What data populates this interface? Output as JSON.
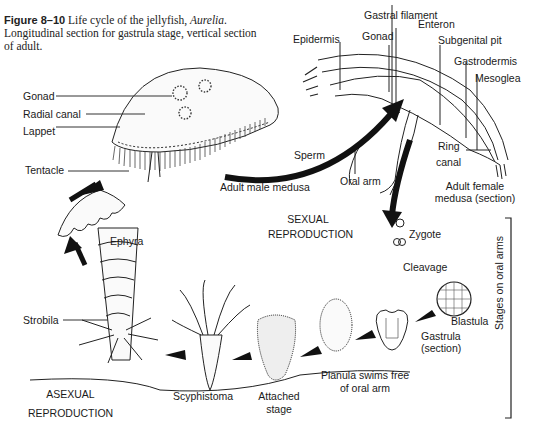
{
  "caption": {
    "figure_number": "Figure 8–10",
    "text_before_italic": "Life cycle of the jellyfish, ",
    "italic_genus": "Aurelia",
    "text_after_italic": ". Longitudinal section for gastrula stage, vertical section of adult."
  },
  "labels": {
    "gastral_filament": "Gastral filament",
    "enteron": "Enteron",
    "epidermis": "Epidermis",
    "gonad_right": "Gonad",
    "subgenital_pit": "Subgenital pit",
    "gastrodermis": "Gastrodermis",
    "mesoglea": "Mesoglea",
    "gonad_left": "Gonad",
    "radial_canal": "Radial canal",
    "lappet": "Lappet",
    "tentacle": "Tentacle",
    "sperm": "Sperm",
    "ring_canal_1": "Ring",
    "ring_canal_2": "canal",
    "oral_arm": "Oral arm",
    "adult_male_medusa": "Adult male medusa",
    "adult_female_1": "Adult female",
    "adult_female_2": "medusa (section)",
    "sexual_1": "SEXUAL",
    "sexual_2": "REPRODUCTION",
    "zygote": "Zygote",
    "cleavage": "Cleavage",
    "blastula": "Blastula",
    "gastrula_1": "Gastrula",
    "gastrula_2": "(section)",
    "stages_on_oral_arms": "Stages on oral arms",
    "ephyra": "Ephyra",
    "strobila": "Strobila",
    "planula_1": "Planula swims free",
    "planula_2": "of oral arm",
    "scyphistoma": "Scyphistoma",
    "attached_1": "Attached",
    "attached_2": "stage",
    "asexual_1": "ASEXUAL",
    "asexual_2": "REPRODUCTION"
  }
}
